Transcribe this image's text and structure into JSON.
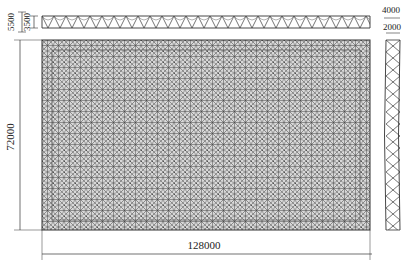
{
  "drawing": {
    "type": "space truss structure - plan and elevations",
    "dimensions": {
      "length": "128000",
      "width": "72000",
      "elevation_total_height": "5500",
      "elevation_truss_depth": "3500",
      "side_total_height": "4000",
      "side_truss_depth": "2000"
    },
    "colors": {
      "line": "#3a3a3a",
      "grid": "#555555",
      "background": "#ffffff"
    }
  }
}
